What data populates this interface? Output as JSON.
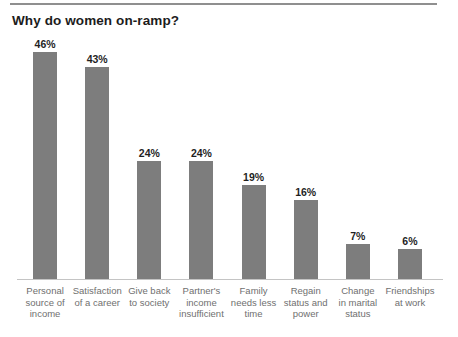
{
  "page": {
    "title": "Why do women on-ramp?"
  },
  "colors": {
    "bar": "#7d7d7d",
    "baseline": "#c4c4c4",
    "top_border": "#8f8f8f",
    "title_text": "#1c1c1c",
    "value_label_text": "#1f1f1f",
    "category_label_text": "#6f6f6f",
    "background": "#ffffff"
  },
  "chart_data": {
    "type": "bar",
    "title": "Why do women on-ramp?",
    "categories": [
      "Personal\nsource of\nincome",
      "Satisfaction\nof a career",
      "Give back\nto society",
      "Partner's\nincome\ninsufficient",
      "Family\nneeds less\ntime",
      "Regain\nstatus and\npower",
      "Change\nin marital\nstatus",
      "Friendships\nat work"
    ],
    "values": [
      46,
      43,
      24,
      24,
      19,
      16,
      7,
      6
    ],
    "value_labels": [
      "46%",
      "43%",
      "24%",
      "24%",
      "19%",
      "16%",
      "7%",
      "6%"
    ],
    "unit": "%",
    "xlabel": "",
    "ylabel": "",
    "ylim": [
      0,
      50
    ],
    "grid": false,
    "legend": "none",
    "bar_color": "#7d7d7d"
  }
}
